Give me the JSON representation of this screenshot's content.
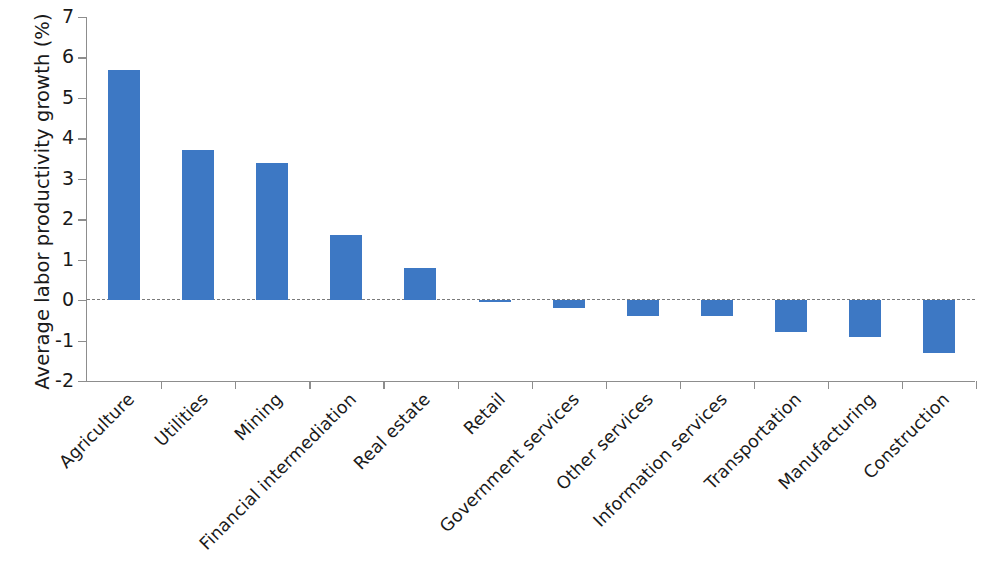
{
  "chart_data": {
    "type": "bar",
    "title": "",
    "subtitle": "",
    "xlabel": "",
    "ylabel": "Average labor productivity growth (%)",
    "ylim": [
      -2,
      7
    ],
    "yticks": [
      7,
      6,
      5,
      4,
      3,
      2,
      1,
      0,
      -1,
      -2
    ],
    "ytick_labels": [
      "7",
      "6",
      "5",
      "4",
      "3",
      "2",
      "1",
      "0",
      "-1",
      "-2"
    ],
    "grid": false,
    "legend": null,
    "zero_reference_line": true,
    "bar_color": "#3d78c4",
    "axis_color": "#8d8d8d",
    "categories": [
      "Agriculture",
      "Utilities",
      "Mining",
      "Financial intermediation",
      "Real estate",
      "Retail",
      "Government services",
      "Other services",
      "Information services",
      "Transportation",
      "Manufacturing",
      "Construction"
    ],
    "values": [
      5.7,
      3.7,
      3.4,
      1.6,
      0.8,
      -0.05,
      -0.2,
      -0.4,
      -0.4,
      -0.8,
      -0.9,
      -1.3
    ]
  }
}
